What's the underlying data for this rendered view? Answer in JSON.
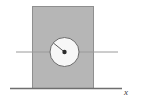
{
  "figure": {
    "title": "",
    "background_color": "#ffffff",
    "width": 141,
    "height": 103,
    "axis_label_x": "x",
    "block": {
      "name": "rectangular-block",
      "fill_color": "#b6b6b6",
      "stroke_color": "#8f8f8f",
      "x": 32.5,
      "y": 6.5,
      "width": 61,
      "height": 82
    },
    "disk": {
      "name": "circular-disk",
      "fill_color": "#f7f7f7",
      "stroke_color": "#6b6b6b",
      "center_x": 64.5,
      "center_y": 52,
      "radius": 14.5
    },
    "center_dot": {
      "name": "disk-center-point",
      "color": "#2b2b2b",
      "x": 64.5,
      "y": 52,
      "radius": 2.2
    },
    "radius_line": {
      "name": "disk-radius-line",
      "color": "#4a4a4a",
      "x1": 64.5,
      "y1": 52,
      "x2": 53.6,
      "y2": 43.2
    },
    "horizontal_axis": {
      "name": "horizontal-axis-line",
      "color": "#9a9a9a",
      "x1": 16,
      "y1": 52,
      "x2": 118,
      "y2": 52
    },
    "ground_line": {
      "name": "ground-line",
      "color": "#6e6e6e",
      "x1": 10,
      "y1": 88.5,
      "x2": 122,
      "y2": 88.5
    },
    "x_label_pos": {
      "x": 124,
      "y": 95
    }
  }
}
